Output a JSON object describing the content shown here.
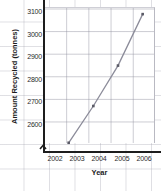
{
  "chart_data": {
    "type": "line",
    "title": "",
    "xlabel": "Year",
    "ylabel": "Amount Recycled (tonnes)",
    "x": [
      2003,
      2004,
      2005,
      2006
    ],
    "values": [
      2600,
      2750,
      2915,
      3125
    ],
    "series": [
      {
        "name": "Amount Recycled",
        "values": [
          2600,
          2750,
          2915,
          3125
        ]
      }
    ],
    "xticklabels": [
      "2002",
      "2003",
      "2004",
      "2005",
      "2006"
    ],
    "yticklabels": [
      "2600",
      "2700",
      "2800",
      "2900",
      "3000",
      "3100"
    ],
    "xlim": [
      2002,
      2006.5
    ],
    "ylim": [
      2600,
      3150
    ],
    "grid": true,
    "legend": "none",
    "axis_break": "y-axis break below 2600",
    "line_color": "#8c8c9a",
    "marker_color": "#5a5a66"
  },
  "axes": {
    "x_title": "Year",
    "y_title": "Amount Recycled (tonnes)",
    "y_ticks": [
      "3100",
      "3000",
      "2900",
      "2800",
      "2700",
      "2600"
    ],
    "x_ticks": [
      "2002",
      "2003",
      "2004",
      "2005",
      "2006"
    ]
  }
}
